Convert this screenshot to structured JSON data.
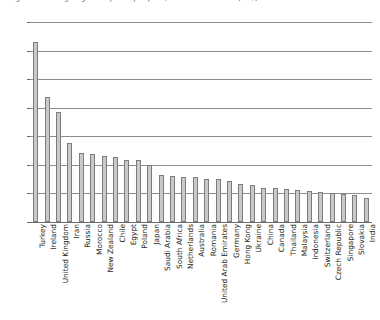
{
  "chart_title": "Figure 3. Average cigarette prices per pack, selected countries (US$)",
  "chart_data": {
    "type": "bar",
    "title": "",
    "xlabel": "",
    "ylabel": "",
    "ylim": [
      0,
      3.5
    ],
    "ytick_labels": [
      "0",
      "0.5",
      "1",
      "1.5",
      "2",
      "2.5",
      "3",
      "3.5"
    ],
    "ytick_values": [
      0,
      0.5,
      1,
      1.5,
      2,
      2.5,
      3,
      3.5
    ],
    "grid": true,
    "legend": false,
    "orientation": "vertical",
    "categories": [
      "Turkey",
      "Ireland",
      "United Kingdom",
      "Iran",
      "Russia",
      "Morocco",
      "New Zealand",
      "Chile",
      "Egypt",
      "Poland",
      "Japan",
      "Saudi Arabia",
      "South Africa",
      "Netherlands",
      "Australia",
      "Romania",
      "United Arab Emirates",
      "Germany",
      "Hong Kong",
      "Ukraine",
      "China",
      "Canada",
      "Thailand",
      "Malaysia",
      "Indonesia",
      "Switzerland",
      "Czech Republic",
      "Singapore",
      "Slovakia",
      "India"
    ],
    "values": [
      3.15,
      2.18,
      1.93,
      1.38,
      1.2,
      1.19,
      1.15,
      1.13,
      1.08,
      1.08,
      1.0,
      0.82,
      0.8,
      0.79,
      0.78,
      0.76,
      0.75,
      0.72,
      0.66,
      0.65,
      0.6,
      0.59,
      0.58,
      0.56,
      0.54,
      0.52,
      0.5,
      0.49,
      0.47,
      0.42
    ]
  }
}
